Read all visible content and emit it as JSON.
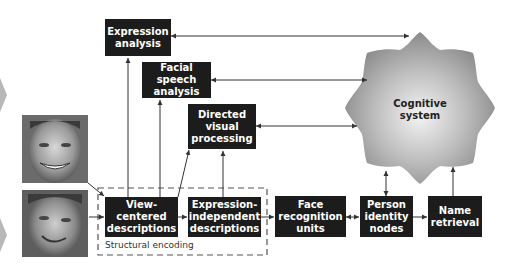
{
  "diagram": {
    "type": "face-recognition-model",
    "boxes": {
      "expression_analysis": "Expression\nanalysis",
      "facial_speech_analysis": "Facial speech\nanalysis",
      "directed_visual_processing": "Directed\nvisual\nprocessing",
      "view_centered_descriptions": "View-centered\ndescriptions",
      "expression_independent_descriptions": "Expression-\nindependent\ndescriptions",
      "face_recognition_units": "Face\nrecognition\nunits",
      "person_identity_nodes": "Person\nidentity\nnodes",
      "name_retrieval": "Name\nretrieval"
    },
    "cognitive_system": "Cognitive\nsystem",
    "structural_encoding_label": "Structural encoding",
    "photos": [
      "face-photo-smiling",
      "face-photo-grimacing"
    ],
    "colors": {
      "box_fill": "#1c1c1c",
      "box_text": "#ffffff",
      "arrow": "#333333",
      "star_edge": "#8a8a8a",
      "star_center": "#f2f2f2",
      "chevron": "#b5b5b5",
      "dashed_border": "#555555"
    }
  }
}
